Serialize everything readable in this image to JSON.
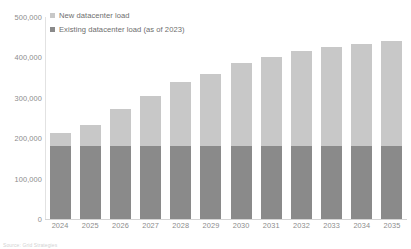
{
  "chart_data": {
    "type": "bar",
    "subtype": "stacked-bar",
    "title": "",
    "xlabel": "",
    "ylabel": "",
    "ylim": [
      0,
      500000
    ],
    "ytick_values": [
      0,
      100000,
      200000,
      300000,
      400000,
      500000
    ],
    "ytick_labels": [
      "0",
      "100,000",
      "200,000",
      "300,000",
      "400,000",
      "500,000"
    ],
    "grid": false,
    "legend_position": "top-left",
    "categories": [
      "2024",
      "2025",
      "2026",
      "2027",
      "2028",
      "2029",
      "2030",
      "2031",
      "2032",
      "2033",
      "2034",
      "2035"
    ],
    "series": [
      {
        "name": "Existing datacenter load (as of 2023)",
        "color": "#8a8a8a",
        "values": [
          181000,
          181000,
          181000,
          181000,
          181000,
          181000,
          181000,
          181000,
          181000,
          181000,
          181000,
          181000
        ]
      },
      {
        "name": "New datacenter load",
        "color": "#c8c8c8",
        "values": [
          32000,
          52000,
          91000,
          123000,
          157000,
          179000,
          204000,
          221000,
          234000,
          244000,
          252000,
          259000
        ]
      }
    ],
    "totals": [
      213000,
      233000,
      272000,
      304000,
      338000,
      360000,
      385000,
      402000,
      415000,
      425000,
      433000,
      440000
    ]
  },
  "legend": {
    "items": [
      {
        "label": "New datacenter load",
        "color": "#c8c8c8"
      },
      {
        "label": "Existing datacenter load (as of 2023)",
        "color": "#8a8a8a"
      }
    ]
  },
  "axes": {
    "y_labels": [
      "500,000",
      "400,000",
      "300,000",
      "200,000",
      "100,000",
      "0"
    ],
    "x_labels": [
      "2024",
      "2025",
      "2026",
      "2027",
      "2028",
      "2029",
      "2030",
      "2031",
      "2032",
      "2033",
      "2034",
      "2035"
    ]
  },
  "footer": {
    "source_note": "Source: Grid Strategies"
  },
  "colors": {
    "new_load": "#c8c8c8",
    "existing_load": "#8a8a8a",
    "axis": "#d4d4d4",
    "text": "#8c8c8c"
  }
}
